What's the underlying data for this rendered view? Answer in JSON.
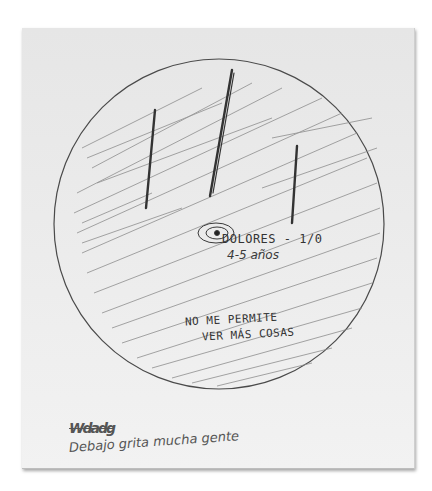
{
  "drawing": {
    "description": "Hand-drawn circle filled with diagonal scribbles and three vertical strokes",
    "colors": {
      "paper": "#ececec",
      "pencil": "#4a4a4a",
      "scribble": "#8a8a8a"
    }
  },
  "annotations": {
    "label_line1": "DOLORES - 1/0",
    "label_line2": "4-5 años",
    "center_note_line1": "NO ME PERMITE",
    "center_note_line2": "VER MÁS COSAS",
    "crossed_out": "Wdadg",
    "bottom_note": "Debajo grita mucha gente"
  },
  "icons": {
    "target": "spiral-target-icon"
  }
}
